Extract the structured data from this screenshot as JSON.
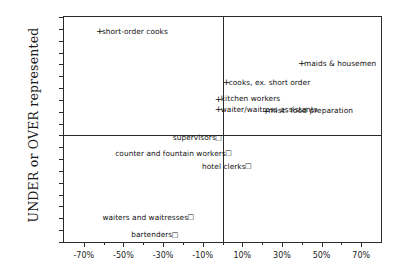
{
  "chart_data": {
    "type": "scatter",
    "title": "",
    "xlabel": "",
    "ylabel": "UNDER or OVER represented",
    "xlim": [
      -80,
      80
    ],
    "ylim": [
      -90,
      100
    ],
    "grid": false,
    "legend": "none",
    "x_ticks": [
      "-70%",
      "-50%",
      "-30%",
      "-10%",
      "10%",
      "30%",
      "50%",
      "70%"
    ],
    "x_tick_values": [
      -70,
      -50,
      -30,
      -10,
      10,
      30,
      50,
      70
    ],
    "x_minor_tick_values": [
      -80,
      -60,
      -40,
      -20,
      0,
      20,
      40,
      60,
      80
    ],
    "y_ticks": [
      "100%",
      "90%",
      "80%",
      "70%",
      "60%",
      "50%",
      "40%",
      "30%",
      "20%",
      "10%",
      "0%",
      "-10%",
      "-20%",
      "-30%",
      "-40%",
      "-50%",
      "-60%",
      "-70%",
      "-80%",
      "-90%"
    ],
    "y_tick_values": [
      100,
      90,
      80,
      70,
      60,
      50,
      40,
      30,
      20,
      10,
      0,
      -10,
      -20,
      -30,
      -40,
      -50,
      -60,
      -70,
      -80,
      -90
    ],
    "zero_lines": {
      "x": 0,
      "y": 0
    },
    "points": [
      {
        "label": "short-order cooks",
        "x": -62,
        "y": 88,
        "marker": "+",
        "label_side": "right"
      },
      {
        "label": "maids & housemen",
        "x": 40,
        "y": 61,
        "marker": "+",
        "label_side": "right"
      },
      {
        "label": "cooks, ex. short order",
        "x": 2,
        "y": 45,
        "marker": "+",
        "label_side": "right"
      },
      {
        "label": "kitchen workers",
        "x": -2,
        "y": 31,
        "marker": "+",
        "label_side": "right"
      },
      {
        "label": "waiter/waitress assistants",
        "x": -2,
        "y": 22,
        "marker": "+",
        "label_side": "right"
      },
      {
        "label": "misc. food preparation",
        "x": 22,
        "y": 21,
        "marker": "+",
        "label_side": "right"
      },
      {
        "label": "supervisors",
        "x": -2,
        "y": -2,
        "marker": "sq",
        "label_side": "left"
      },
      {
        "label": "counter and fountain workers",
        "x": 3,
        "y": -15,
        "marker": "sq",
        "label_side": "left"
      },
      {
        "label": "hotel clerks",
        "x": 13,
        "y": -26,
        "marker": "sq",
        "label_side": "left"
      },
      {
        "label": "waiters and waitresses",
        "x": -16,
        "y": -69,
        "marker": "sq",
        "label_side": "left"
      },
      {
        "label": "bartenders",
        "x": -24,
        "y": -84,
        "marker": "sq",
        "label_side": "left"
      }
    ]
  }
}
